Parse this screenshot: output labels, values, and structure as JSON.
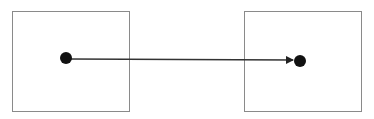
{
  "diagram": {
    "colors": {
      "box_stroke": "#8a8a8a",
      "dot": "#111111",
      "arrow": "#333333",
      "background": "#ffffff"
    },
    "nodes": [
      {
        "id": "left-box",
        "x": 12,
        "y": 11,
        "w": 117,
        "h": 100,
        "dot": {
          "cx": 66,
          "cy": 58,
          "r": 6
        }
      },
      {
        "id": "right-box",
        "x": 244,
        "y": 11,
        "w": 117,
        "h": 100,
        "dot": {
          "cx": 300,
          "cy": 61,
          "r": 6
        }
      }
    ],
    "edges": [
      {
        "from": "left-box",
        "to": "right-box",
        "x1": 70,
        "y1": 59,
        "x2": 292,
        "y2": 60,
        "arrowhead": "end"
      }
    ]
  }
}
